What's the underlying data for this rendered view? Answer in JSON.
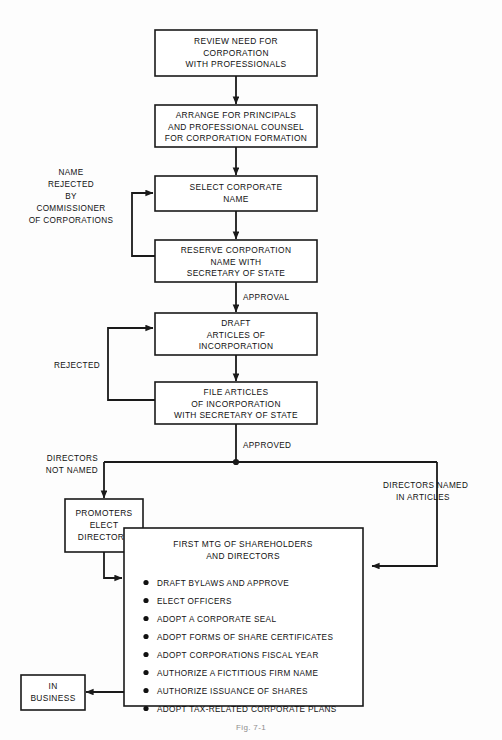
{
  "figure": {
    "caption": "Fig. 7-1"
  },
  "nodes": {
    "review_need": {
      "lines": [
        "REVIEW NEED FOR",
        "CORPORATION",
        "WITH PROFESSIONALS"
      ]
    },
    "arrange_principals": {
      "lines": [
        "ARRANGE FOR PRINCIPALS",
        "AND PROFESSIONAL COUNSEL",
        "FOR CORPORATION FORMATION"
      ]
    },
    "select_name": {
      "lines": [
        "SELECT CORPORATE",
        "NAME"
      ]
    },
    "reserve_name": {
      "lines": [
        "RESERVE CORPORATION",
        "NAME WITH",
        "SECRETARY OF STATE"
      ]
    },
    "draft_articles": {
      "lines": [
        "DRAFT",
        "ARTICLES OF",
        "INCORPORATION"
      ]
    },
    "file_articles": {
      "lines": [
        "FILE ARTICLES",
        "OF INCORPORATION",
        "WITH SECRETARY OF STATE"
      ]
    },
    "promoters_elect": {
      "lines": [
        "PROMOTERS",
        "ELECT",
        "DIRECTORS"
      ]
    },
    "first_meeting": {
      "heading": [
        "FIRST MTG OF SHAREHOLDERS",
        "AND DIRECTORS"
      ],
      "bullets": [
        "DRAFT BYLAWS AND APPROVE",
        "ELECT OFFICERS",
        "ADOPT A CORPORATE SEAL",
        "ADOPT FORMS OF SHARE CERTIFICATES",
        "ADOPT CORPORATIONS FISCAL YEAR",
        "AUTHORIZE A FICTITIOUS FIRM NAME",
        "AUTHORIZE ISSUANCE OF SHARES",
        "ADOPT TAX-RELATED CORPORATE PLANS"
      ]
    },
    "in_business": {
      "lines": [
        "IN",
        "BUSINESS"
      ]
    }
  },
  "edge_labels": {
    "name_rejected": [
      "NAME",
      "REJECTED",
      "BY",
      "COMMISSIONER",
      "OF CORPORATIONS"
    ],
    "approval": "APPROVAL",
    "rejected": "REJECTED",
    "approved": "APPROVED",
    "directors_not_named": [
      "DIRECTORS",
      "NOT NAMED"
    ],
    "directors_named": [
      "DIRECTORS NAMED",
      "IN ARTICLES"
    ]
  },
  "colors": {
    "stroke": "#1a1a1a",
    "text": "#111111",
    "background": "#fdfdfd",
    "box_fill": "#ffffff",
    "caption": "#8d8d8d"
  }
}
